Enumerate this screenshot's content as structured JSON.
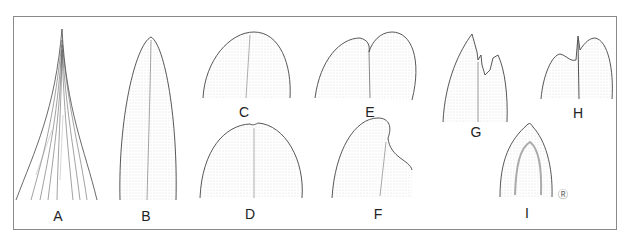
{
  "figure": {
    "panels": [
      {
        "id": "A",
        "label": "A",
        "shape": "acuminate",
        "x": 58,
        "y": 209
      },
      {
        "id": "B",
        "label": "B",
        "shape": "acute",
        "x": 146,
        "y": 209
      },
      {
        "id": "C",
        "label": "C",
        "shape": "obtuse",
        "x": 244,
        "y": 105
      },
      {
        "id": "D",
        "label": "D",
        "shape": "retuse",
        "x": 250,
        "y": 207
      },
      {
        "id": "E",
        "label": "E",
        "shape": "emarginate",
        "x": 370,
        "y": 105
      },
      {
        "id": "F",
        "label": "F",
        "shape": "oblique",
        "x": 378,
        "y": 207
      },
      {
        "id": "G",
        "label": "G",
        "shape": "erose",
        "x": 476,
        "y": 125
      },
      {
        "id": "H",
        "label": "H",
        "shape": "mucronate",
        "x": 578,
        "y": 106
      },
      {
        "id": "I",
        "label": "I",
        "shape": "cuspidate",
        "x": 527,
        "y": 206
      }
    ],
    "signature": "Ⓡ"
  },
  "colors": {
    "line": "#444444",
    "stipple": "#bdbdbd",
    "border": "#8a8a8a"
  }
}
